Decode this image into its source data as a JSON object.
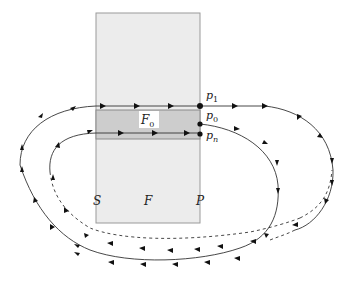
{
  "diagram": {
    "labels": {
      "p1": "p",
      "p1_sub": "1",
      "p0": "p",
      "p0_sub": "0",
      "pn": "p",
      "pn_sub": "n",
      "F0": "F",
      "F0_sub": "0",
      "S": "S",
      "F": "F",
      "P": "P"
    },
    "colors": {
      "rect_fill": "#ececec",
      "band_fill": "#cdcdcd",
      "stroke": "#808080",
      "curve": "#333333",
      "point": "#111111"
    }
  }
}
